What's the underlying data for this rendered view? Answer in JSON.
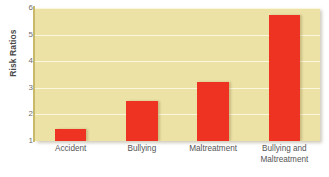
{
  "chart_data": {
    "type": "bar",
    "title": "",
    "xlabel": "",
    "ylabel": "Risk Ratios",
    "categories": [
      "Accident",
      "Bullying",
      "Maltreatment",
      "Bullying and Maltreatment"
    ],
    "category_lines": [
      [
        "Accident"
      ],
      [
        "Bullying"
      ],
      [
        "Maltreatment"
      ],
      [
        "Bullying and",
        "Maltreatment"
      ]
    ],
    "values": [
      1.45,
      2.5,
      3.2,
      5.75
    ],
    "ylim": [
      1,
      6
    ],
    "yticks": [
      1,
      2,
      3,
      4,
      5,
      6
    ],
    "ytick_labels": [
      "1",
      "2",
      "3",
      "4",
      "5",
      "6"
    ],
    "grid": true,
    "legend": "none",
    "colors": {
      "bar": "#ee3322",
      "plot_background": "#ece2a6",
      "gridline": "#fbf7dd",
      "axis_line": "#c9b96b",
      "tick_text": "#6e6e6e",
      "label_text": "#555555",
      "axis_title_text": "#4a4a4a",
      "page_background": "#ffffff"
    }
  }
}
